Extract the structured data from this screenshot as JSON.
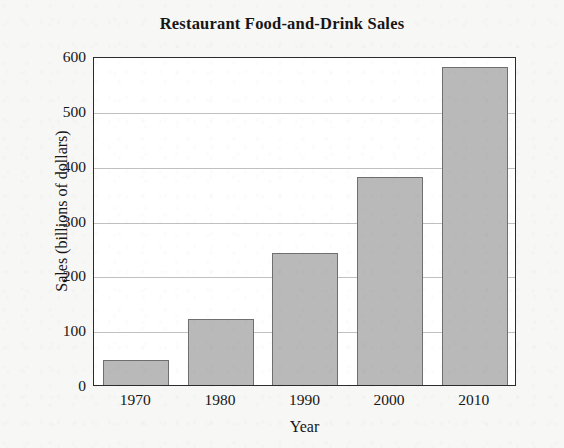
{
  "chart_data": {
    "type": "bar",
    "title": "Restaurant Food-and-Drink Sales",
    "xlabel": "Year",
    "ylabel": "Sales (billions of dollars)",
    "categories": [
      "1970",
      "1980",
      "1990",
      "2000",
      "2010"
    ],
    "values": [
      45,
      120,
      240,
      380,
      580
    ],
    "series": [
      {
        "name": "Sales",
        "values": [
          45,
          120,
          240,
          380,
          580
        ]
      }
    ],
    "ylim": [
      0,
      600
    ],
    "yticks": [
      "0",
      "100",
      "200",
      "300",
      "400",
      "500",
      "600"
    ],
    "ytick_values": [
      0,
      100,
      200,
      300,
      400,
      500,
      600
    ],
    "grid": true,
    "grid_axis": "y",
    "legend": "none",
    "bar_color": "#b9b9b9",
    "bar_edge_color": "#6f6f6f",
    "axis_color": "#2b2b2b",
    "grid_color": "#9a9a9a",
    "plot_background": "#ffffff",
    "figure_background": "#f7f7f5",
    "text_color": "#161616"
  }
}
